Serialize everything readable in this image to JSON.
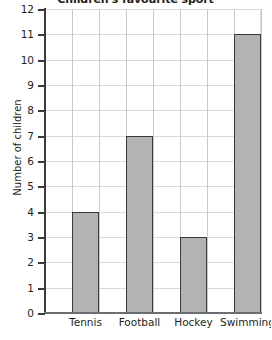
{
  "chart_data": {
    "type": "bar",
    "title": "Children's favourite sport",
    "xlabel": "",
    "ylabel": "Number of children",
    "categories": [
      "Tennis",
      "Football",
      "Hockey",
      "Swimming"
    ],
    "values": [
      4,
      7,
      3,
      11
    ],
    "ylim": [
      0,
      12
    ],
    "ytick_labels": [
      "0",
      "1",
      "2",
      "3",
      "4",
      "5",
      "6",
      "7",
      "8",
      "9",
      "10",
      "11",
      "12"
    ],
    "grid": true,
    "legend": false,
    "colors": {
      "bar_fill": "#b3b3b3",
      "bar_edge": "#3a3a3c",
      "gridline": "#d9d9d9",
      "axis": "#6d6e71",
      "text": "#231f20",
      "background": "#ffffff"
    }
  }
}
